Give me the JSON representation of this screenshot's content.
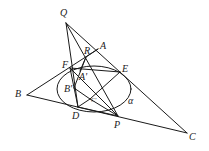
{
  "diagram": {
    "type": "geometry-figure",
    "stroke_color": "#1a1a1a",
    "background": "#ffffff",
    "points": {
      "Q": {
        "label": "Q",
        "x": 66,
        "y": 23
      },
      "A": {
        "label": "A",
        "x": 98,
        "y": 49
      },
      "R": {
        "label": "R",
        "x": 86,
        "y": 57
      },
      "F": {
        "label": "F",
        "x": 70,
        "y": 68
      },
      "E": {
        "label": "E",
        "x": 120,
        "y": 72
      },
      "A_prime": {
        "label": "A'",
        "x": 80,
        "y": 71
      },
      "B": {
        "label": "B",
        "x": 27,
        "y": 95
      },
      "B_prime": {
        "label": "B'",
        "x": 74,
        "y": 88
      },
      "C_prime": {
        "label": "C'",
        "x": 90,
        "y": 99
      },
      "D": {
        "label": "D",
        "x": 78,
        "y": 107
      },
      "P": {
        "label": "P",
        "x": 118,
        "y": 116
      },
      "C": {
        "label": "C",
        "x": 187,
        "y": 133
      }
    },
    "ellipse": {
      "label": "α",
      "cx": 94,
      "cy": 89,
      "rx": 37,
      "ry": 23
    },
    "segments": [
      [
        "Q",
        "C"
      ],
      [
        "B",
        "A"
      ],
      [
        "B",
        "C"
      ],
      [
        "Q",
        "D"
      ],
      [
        "Q",
        "P"
      ],
      [
        "F",
        "E"
      ],
      [
        "R",
        "A"
      ],
      [
        "R",
        "C_prime"
      ],
      [
        "F",
        "D"
      ],
      [
        "E",
        "D"
      ],
      [
        "F",
        "P"
      ],
      [
        "B_prime",
        "C_prime"
      ],
      [
        "D",
        "P"
      ],
      [
        "E",
        "B_prime"
      ]
    ]
  }
}
